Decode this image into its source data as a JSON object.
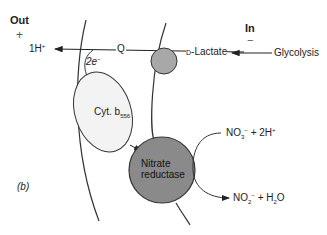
{
  "figure": {
    "panel_label": "(b)",
    "side_out": {
      "label": "Out",
      "charge": "+"
    },
    "side_in": {
      "label": "In",
      "charge": "−"
    },
    "membrane": {
      "count": 2,
      "color": "#333333"
    },
    "nodes": {
      "proton": {
        "label": "1H",
        "superscript": "+"
      },
      "quinone": {
        "label": "Q"
      },
      "electrons": {
        "label": "2e",
        "superscript": "−"
      },
      "d_lactate": {
        "label": "D-Lactate",
        "prefix": "D",
        "name": "-Lactate"
      },
      "glycolysis": {
        "label": "Glycolysis"
      },
      "dehydrogenase": {
        "label": "",
        "fill": "#a8a8a8"
      },
      "cytochrome": {
        "label": "Cyt. b",
        "subscript": "556",
        "fill": "#f2f2f2"
      },
      "nitrate_reductase": {
        "line1": "Nitrate",
        "line2": "reductase",
        "fill": "#8a8a8a"
      },
      "nitrate_in": {
        "formula": "NO",
        "subscript": "3",
        "superscript": "−",
        "plus": "+ 2H",
        "plus_sup": "+"
      },
      "nitrite_out": {
        "formula": "NO",
        "subscript": "2",
        "superscript": "−",
        "plus": "+ H",
        "plus_sub": "2",
        "tail": "O"
      }
    },
    "arrows": [
      {
        "from": "glycolysis",
        "to": "d_lactate"
      },
      {
        "from": "d_lactate",
        "to": "proton",
        "via": "quinone"
      },
      {
        "from": "quinone",
        "to": "cytochrome",
        "label": "2e−"
      },
      {
        "from": "cytochrome",
        "to": "nitrate_reductase"
      },
      {
        "from": "nitrate_in",
        "to": "nitrite_out",
        "via": "nitrate_reductase"
      }
    ]
  }
}
